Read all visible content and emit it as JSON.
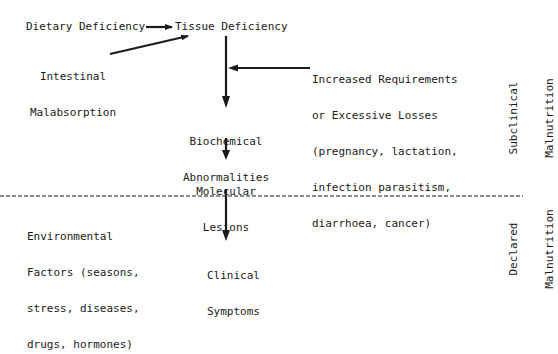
{
  "diagram": {
    "nodes": {
      "dietary_deficiency": "Dietary Deficiency",
      "tissue_deficiency": "Tissue Deficiency",
      "intestinal_malabsorption": [
        "Intestinal",
        "Malabsorption"
      ],
      "increased_requirements": [
        "Increased Requirements",
        "or Excessive Losses",
        "(pregnancy, lactation,",
        "infection parasitism,",
        "diarrhoea, cancer)"
      ],
      "biochemical_abnormalities": [
        "Biochemical",
        "Abnormalities"
      ],
      "molecular_lesions": [
        "Molecular",
        "Lesions"
      ],
      "environmental_factors": [
        "Environmental",
        "Factors (seasons,",
        "stress, diseases,",
        "drugs, hormones)"
      ],
      "clinical_symptoms": [
        "Clinical",
        "Symptoms"
      ]
    },
    "side_labels": {
      "subclinical": [
        "Subclinical",
        "Malnutrition"
      ],
      "declared": [
        "Declared",
        "Malnutrition"
      ]
    },
    "edges": [
      {
        "from": "Dietary Deficiency",
        "to": "Tissue Deficiency"
      },
      {
        "from": "Intestinal Malabsorption",
        "to": "Tissue Deficiency"
      },
      {
        "from": "Tissue Deficiency",
        "to": "Biochemical Abnormalities"
      },
      {
        "from": "Increased Requirements or Excessive Losses",
        "to": "Tissue Deficiency → Biochemical Abnormalities path"
      },
      {
        "from": "Biochemical Abnormalities",
        "to": "Molecular Lesions"
      },
      {
        "from": "Molecular Lesions",
        "to": "Clinical Symptoms"
      }
    ],
    "divider": "dashed line separating subclinical and declared malnutrition",
    "colors": {
      "ink": "#1a1a1a",
      "background": "#ffffff"
    }
  }
}
